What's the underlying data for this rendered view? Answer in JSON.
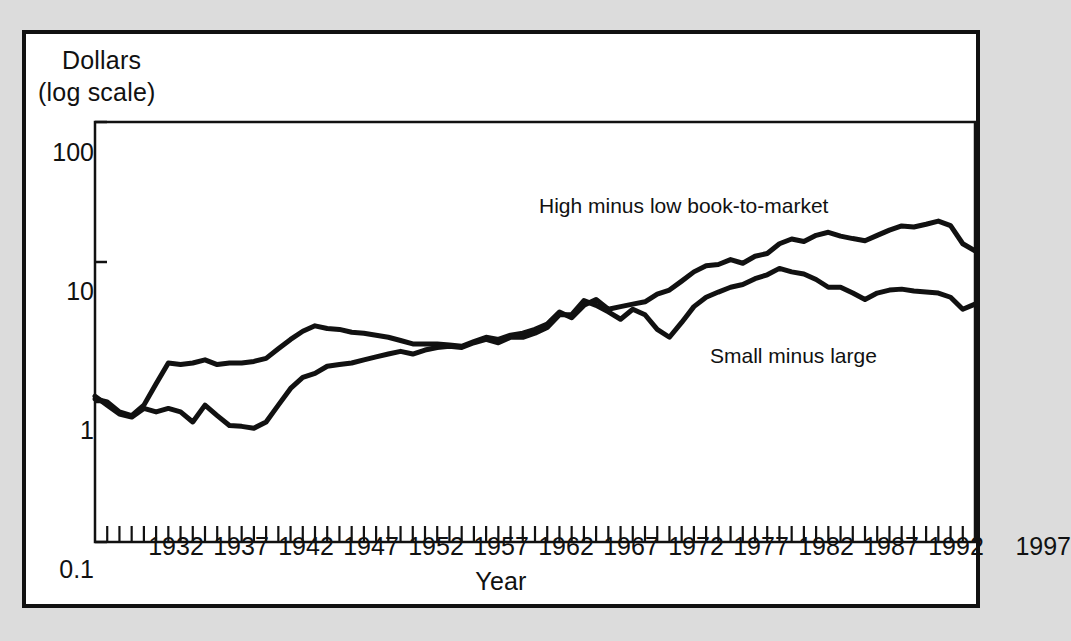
{
  "figure": {
    "background_color": "#dcdcdc",
    "panel_color": "#ffffff",
    "border_color": "#111111",
    "line_color": "#111111"
  },
  "axes": {
    "y_caption_line1": "Dollars",
    "y_caption_line2": "(log scale)",
    "x_caption": "Year",
    "y_tick_labels": [
      "100",
      "10",
      "1",
      "0.1"
    ],
    "x_tick_labels": [
      "1932",
      "1937",
      "1942",
      "1947",
      "1952",
      "1957",
      "1962",
      "1967",
      "1972",
      "1977",
      "1982",
      "1987",
      "1992",
      "1997"
    ]
  },
  "annotations": {
    "high_minus_low": "High minus low book-to-market",
    "small_minus_large": "Small minus large"
  },
  "chart_data": {
    "type": "line",
    "title": "",
    "xlabel": "Year",
    "ylabel": "Dollars (log scale)",
    "yscale": "log",
    "ylim": [
      0.1,
      100
    ],
    "xlim": [
      1927,
      1999
    ],
    "grid": false,
    "legend_position": "inline-annotation",
    "y_ticks": [
      0.1,
      1,
      10,
      100
    ],
    "x_ticks": [
      1932,
      1937,
      1942,
      1947,
      1952,
      1957,
      1962,
      1967,
      1972,
      1977,
      1982,
      1987,
      1992,
      1997
    ],
    "x_minor_tick_interval": 1,
    "x": [
      1927,
      1928,
      1929,
      1930,
      1931,
      1932,
      1933,
      1934,
      1935,
      1936,
      1937,
      1938,
      1939,
      1940,
      1941,
      1942,
      1943,
      1944,
      1945,
      1946,
      1947,
      1948,
      1949,
      1950,
      1951,
      1952,
      1953,
      1954,
      1955,
      1956,
      1957,
      1958,
      1959,
      1960,
      1961,
      1962,
      1963,
      1964,
      1965,
      1966,
      1967,
      1968,
      1969,
      1970,
      1971,
      1972,
      1973,
      1974,
      1975,
      1976,
      1977,
      1978,
      1979,
      1980,
      1981,
      1982,
      1983,
      1984,
      1985,
      1986,
      1987,
      1988,
      1989,
      1990,
      1991,
      1992,
      1993,
      1994,
      1995,
      1996,
      1997,
      1998,
      1999
    ],
    "series": [
      {
        "name": "High minus low book-to-market",
        "values": [
          1.05,
          1.0,
          0.85,
          0.8,
          0.95,
          1.35,
          1.9,
          1.85,
          1.9,
          2.0,
          1.85,
          1.9,
          1.9,
          1.95,
          2.05,
          2.4,
          2.8,
          3.2,
          3.5,
          3.35,
          3.3,
          3.15,
          3.1,
          3.0,
          2.9,
          2.75,
          2.6,
          2.6,
          2.6,
          2.55,
          2.5,
          2.7,
          2.9,
          2.8,
          3.0,
          3.1,
          3.3,
          3.6,
          4.4,
          4.0,
          4.9,
          5.4,
          4.6,
          4.8,
          5.0,
          5.2,
          5.9,
          6.3,
          7.3,
          8.5,
          9.4,
          9.6,
          10.4,
          9.8,
          11.0,
          11.5,
          13.5,
          14.6,
          14.0,
          15.5,
          16.3,
          15.3,
          14.7,
          14.2,
          15.5,
          16.9,
          18.1,
          17.8,
          18.6,
          19.6,
          18.2,
          13.5,
          12.0
        ]
      },
      {
        "name": "Small minus large",
        "values": [
          1.1,
          0.95,
          0.82,
          0.78,
          0.9,
          0.85,
          0.9,
          0.85,
          0.72,
          0.95,
          0.8,
          0.68,
          0.67,
          0.65,
          0.72,
          0.95,
          1.25,
          1.5,
          1.6,
          1.8,
          1.85,
          1.9,
          2.0,
          2.1,
          2.2,
          2.3,
          2.2,
          2.35,
          2.45,
          2.5,
          2.45,
          2.65,
          2.8,
          2.65,
          2.9,
          2.9,
          3.1,
          3.4,
          4.2,
          4.2,
          5.3,
          4.9,
          4.4,
          3.9,
          4.6,
          4.2,
          3.3,
          2.9,
          3.7,
          4.8,
          5.6,
          6.1,
          6.6,
          6.9,
          7.6,
          8.1,
          9.0,
          8.5,
          8.2,
          7.5,
          6.6,
          6.6,
          6.0,
          5.4,
          6.0,
          6.3,
          6.4,
          6.2,
          6.1,
          6.0,
          5.6,
          4.6,
          5.0
        ]
      }
    ]
  }
}
